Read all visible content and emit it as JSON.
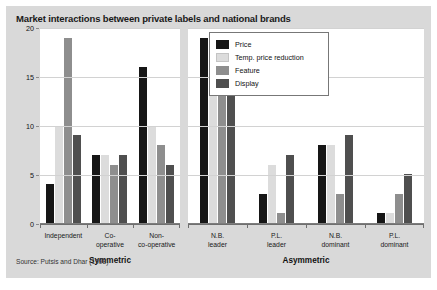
{
  "figure": {
    "title": "Market interactions between private labels and national brands",
    "source": "Source: Putsis and Dhar (1998)"
  },
  "legend": {
    "items": [
      {
        "label": "Price",
        "color": "#161616",
        "key": "price"
      },
      {
        "label": "Temp. price reduction",
        "color": "#dcdcdc",
        "key": "temp"
      },
      {
        "label": "Feature",
        "color": "#8e8e8e",
        "key": "feature"
      },
      {
        "label": "Display",
        "color": "#4f4f4f",
        "key": "display"
      }
    ]
  },
  "axis": {
    "y_ticks": [
      "0",
      "5",
      "10",
      "15",
      "20"
    ],
    "y_min": 0,
    "y_max": 20
  },
  "panels": [
    {
      "name": "Symmetric",
      "categories": [
        {
          "line1": "Independent",
          "line2": ""
        },
        {
          "line1": "Co-",
          "line2": "operative"
        },
        {
          "line1": "Non-",
          "line2": "co-operative"
        }
      ]
    },
    {
      "name": "Asymmetric",
      "categories": [
        {
          "line1": "N.B.",
          "line2": "leader"
        },
        {
          "line1": "P.L.",
          "line2": "leader"
        },
        {
          "line1": "N.B.",
          "line2": "dominant"
        },
        {
          "line1": "P.L.",
          "line2": "dominant"
        }
      ]
    }
  ],
  "chart_data": {
    "type": "bar",
    "title": "Market interactions between private labels and national brands",
    "xlabel": "",
    "ylabel": "",
    "ylim": [
      0,
      20
    ],
    "yticks": [
      0,
      5,
      10,
      15,
      20
    ],
    "grid": true,
    "legend_position": "top-right",
    "panel_groups": [
      "Symmetric",
      "Asymmetric"
    ],
    "categories": [
      "Independent",
      "Co-operative",
      "Non-co-operative",
      "N.B. leader",
      "P.L. leader",
      "N.B. dominant",
      "P.L. dominant"
    ],
    "series": [
      {
        "name": "Price",
        "color": "#161616",
        "values": [
          4,
          7,
          16,
          19,
          3,
          8,
          1
        ]
      },
      {
        "name": "Temp. price reduction",
        "color": "#dcdcdc",
        "values": [
          10,
          7,
          10,
          16,
          6,
          8,
          1
        ]
      },
      {
        "name": "Feature",
        "color": "#8e8e8e",
        "values": [
          19,
          6,
          8,
          19,
          1,
          3,
          3
        ]
      },
      {
        "name": "Display",
        "color": "#4f4f4f",
        "values": [
          9,
          7,
          6,
          15,
          7,
          9,
          5
        ]
      }
    ],
    "source": "Source: Putsis and Dhar (1998)"
  }
}
